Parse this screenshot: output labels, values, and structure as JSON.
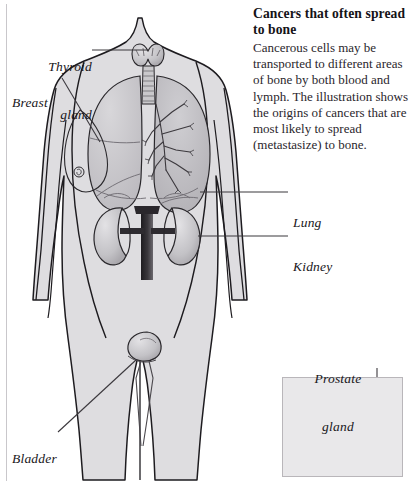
{
  "figure": {
    "title": "Cancers that often spread to bone",
    "caption": "Cancerous cells may be transported to different areas of bone by both blood and lymph. The illustration shows the origins of cancers that are most likely to spread (metastasize) to bone.",
    "inset_subject": "male pelvis sagittal view",
    "colors": {
      "body_fill": "#dedde0",
      "body_outline": "#1d1b1f",
      "organ_fill": "#c6c5c8",
      "organ_outline": "#2a282c",
      "leader_line": "#3b383d",
      "text": "#18161a",
      "inset_background": "#e9e8ea",
      "inset_border": "#b9b6ba",
      "page_background": "#ffffff"
    }
  },
  "labels": {
    "thyroid": {
      "line1": "Thyroid",
      "line2": "gland"
    },
    "breast": {
      "line1": "Breast"
    },
    "lung": {
      "line1": "Lung"
    },
    "kidney": {
      "line1": "Kidney"
    },
    "bladder": {
      "line1": "Bladder"
    },
    "prostate": {
      "line1": "Prostate",
      "line2": "gland"
    }
  }
}
